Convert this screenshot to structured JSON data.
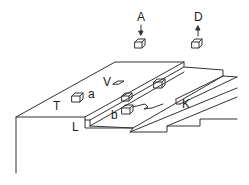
{
  "diagram": {
    "labels": {
      "A": "A",
      "D": "D",
      "V": "V",
      "T": "T",
      "a": "a",
      "b": "b",
      "L": "L",
      "K": "K"
    },
    "colors": {
      "stroke": "#333333",
      "background": "#ffffff"
    }
  }
}
